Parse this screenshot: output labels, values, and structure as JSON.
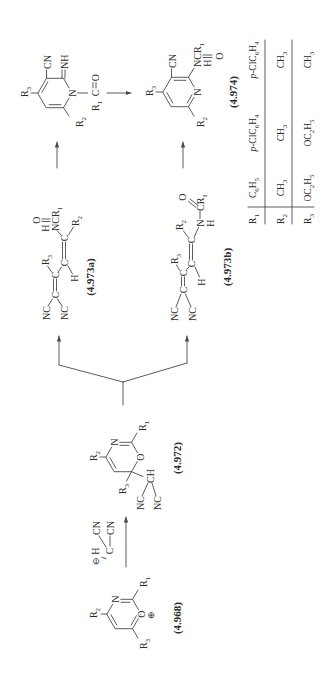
{
  "scheme": {
    "c4968": {
      "label": "(4.968)",
      "n": "N",
      "o": "O",
      "charge": "⊕",
      "r1": [
        "R",
        "1"
      ],
      "r2": [
        "R",
        "2"
      ],
      "r3": [
        "R",
        "3"
      ]
    },
    "reagent": {
      "charge": "⊖",
      "h": "H",
      "c": "C",
      "cn_a": "CN",
      "cn_b": "CN"
    },
    "c4972": {
      "label": "(4.972)",
      "n": "N",
      "o": "O",
      "r1": [
        "R",
        "1"
      ],
      "r2": [
        "R",
        "2"
      ],
      "r3": [
        "R",
        "3"
      ],
      "ch": "CH",
      "nc_a": "NC",
      "nc_b": "NC"
    },
    "c4973a": {
      "label": "(4.973a)",
      "nc_a": "NC",
      "nc_b": "NC",
      "c_a": "C",
      "c_b": "C",
      "c_c": "C",
      "c_d": "C",
      "r2": [
        "R",
        "2"
      ],
      "r3": [
        "R",
        "3"
      ],
      "h": "H",
      "amide": [
        "NCR",
        "1"
      ],
      "amide_h": "H",
      "amide_o": "O"
    },
    "c4973b": {
      "label": "(4.973b)",
      "nc_a": "NC",
      "nc_b": "NC",
      "c_a": "C",
      "c_b": "C",
      "c_c": "C",
      "c_d": "C",
      "r2": [
        "R",
        "2"
      ],
      "r3": [
        "R",
        "3"
      ],
      "h": "H",
      "n": "N",
      "n_h": "H",
      "acyl": [
        "CR",
        "1"
      ],
      "acyl_o": "O"
    },
    "intermediate": {
      "n": "N",
      "cn": "CN",
      "nh": "NH",
      "r2": [
        "R",
        "2"
      ],
      "r3": [
        "R",
        "3"
      ],
      "acyl_r": [
        "R",
        "1"
      ],
      "acyl_c": "C",
      "acyl_o": "O"
    },
    "c4974": {
      "label": "(4.974)",
      "n": "N",
      "cn": "CN",
      "r2": [
        "R",
        "2"
      ],
      "r3": [
        "R",
        "3"
      ],
      "amide": [
        "NCR",
        "1"
      ],
      "amide_h": "H",
      "amide_o": "O"
    }
  },
  "table": {
    "rows": [
      {
        "label": [
          "R",
          "1"
        ],
        "values": [
          [
            "C",
            "6",
            "H",
            "5"
          ],
          [
            "p",
            "-ClC",
            "6",
            "H",
            "4"
          ],
          [
            "p",
            "-ClC",
            "6",
            "H",
            "4"
          ]
        ]
      },
      {
        "label": [
          "R",
          "2"
        ],
        "values": [
          [
            "CH",
            "3"
          ],
          [
            "CH",
            "3"
          ],
          [
            "CH",
            "3"
          ]
        ]
      },
      {
        "label": [
          "R",
          "3"
        ],
        "values": [
          [
            "OC",
            "2",
            "H",
            "5"
          ],
          [
            "OC",
            "2",
            "H",
            "5"
          ],
          [
            "CH",
            "3"
          ]
        ]
      }
    ]
  },
  "colors": {
    "ink": "#2b2b2b",
    "bond": "#4a4a4a",
    "background": "#ffffff"
  }
}
